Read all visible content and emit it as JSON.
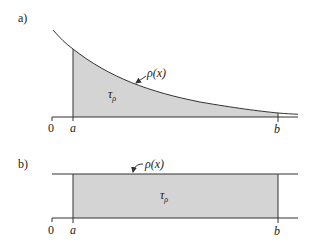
{
  "panel_a": {
    "label": "a)",
    "curve_label": "ρ(x)",
    "area_label": "τ",
    "area_subscript": "ρ",
    "origin_label": "0",
    "a_label": "a",
    "b_label": "b"
  },
  "panel_b": {
    "label": "b)",
    "curve_label": "ρ(x)",
    "area_label": "τ",
    "area_subscript": "ρ",
    "origin_label": "0",
    "a_label": "a",
    "b_label": "b"
  },
  "colors": {
    "fill": "#d4d4d4",
    "line": "#333333"
  }
}
